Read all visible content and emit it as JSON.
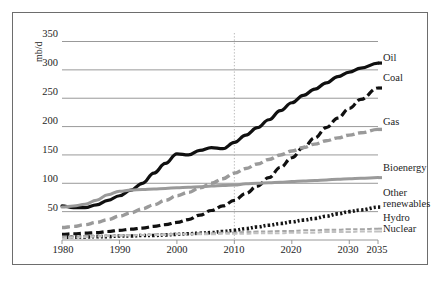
{
  "chart_data": {
    "type": "line",
    "title": "",
    "subtitle": "",
    "xlabel": "",
    "ylabel": "mb/d",
    "xlim": [
      1980,
      2035
    ],
    "ylim": [
      0,
      365
    ],
    "x_ticks": [
      1980,
      1990,
      2000,
      2010,
      2020,
      2030,
      2035
    ],
    "y_ticks": [
      50,
      100,
      150,
      200,
      250,
      300,
      350
    ],
    "grid": "horizontal",
    "legend_position": "right-inline-labels",
    "annotations": [
      {
        "name": "history-projection-divider",
        "type": "vline",
        "x": 2010,
        "style": "dotted"
      }
    ],
    "x": [
      1980,
      1982,
      1984,
      1986,
      1988,
      1990,
      1992,
      1994,
      1996,
      1998,
      2000,
      2002,
      2004,
      2006,
      2008,
      2010,
      2012,
      2014,
      2016,
      2018,
      2020,
      2022,
      2024,
      2026,
      2028,
      2030,
      2032,
      2035
    ],
    "series": [
      {
        "name": "Oil",
        "label": "Oil",
        "color": "#101010",
        "style": "solid",
        "width": 3.2,
        "values": [
          60,
          57,
          57,
          62,
          70,
          78,
          88,
          100,
          118,
          135,
          152,
          150,
          158,
          163,
          161,
          172,
          185,
          198,
          212,
          228,
          242,
          255,
          266,
          277,
          288,
          296,
          303,
          312
        ]
      },
      {
        "name": "Coal",
        "label": "Coal",
        "color": "#101010",
        "style": "dashed",
        "width": 3.2,
        "values": [
          10,
          11,
          12,
          13,
          15,
          17,
          19,
          21,
          24,
          27,
          31,
          36,
          44,
          52,
          60,
          70,
          82,
          95,
          110,
          128,
          145,
          163,
          180,
          198,
          215,
          232,
          248,
          268
        ]
      },
      {
        "name": "Gas",
        "label": "Gas",
        "color": "#9a9a9a",
        "style": "dashed",
        "width": 3.4,
        "values": [
          22,
          24,
          27,
          31,
          36,
          42,
          48,
          55,
          62,
          70,
          78,
          84,
          92,
          100,
          108,
          118,
          126,
          134,
          142,
          150,
          157,
          163,
          169,
          175,
          180,
          185,
          189,
          195
        ]
      },
      {
        "name": "Bioenergy",
        "label": "Bioenergy",
        "color": "#9a9a9a",
        "style": "solid",
        "width": 3.0,
        "values": [
          58,
          60,
          63,
          70,
          80,
          86,
          88,
          89,
          90,
          91,
          92,
          93,
          94,
          95,
          96,
          97,
          99,
          100,
          101,
          102,
          103,
          104,
          105,
          106,
          107,
          108,
          109,
          110
        ]
      },
      {
        "name": "Other renewables",
        "label_line1": "Other",
        "label_line2": "renewables",
        "color": "#141414",
        "style": "dotted",
        "width": 3.6,
        "values": [
          5,
          5,
          5,
          6,
          6,
          7,
          7,
          8,
          8,
          9,
          10,
          11,
          12,
          13,
          15,
          17,
          20,
          23,
          26,
          29,
          32,
          35,
          38,
          42,
          46,
          50,
          53,
          58
        ]
      },
      {
        "name": "Hydro",
        "label": "Hydro",
        "color": "#a6a6a6",
        "style": "dashed",
        "width": 2.0,
        "values": [
          6,
          6,
          7,
          7,
          8,
          8,
          9,
          9,
          10,
          10,
          11,
          11,
          12,
          12,
          13,
          13,
          14,
          15,
          15,
          16,
          16,
          17,
          17,
          18,
          18,
          19,
          19,
          20
        ]
      },
      {
        "name": "Nuclear",
        "label": "Nuclear",
        "color": "#c2c2c2",
        "style": "dashed",
        "width": 2.0,
        "values": [
          3,
          4,
          5,
          6,
          7,
          8,
          8,
          9,
          9,
          9,
          10,
          10,
          10,
          10,
          11,
          11,
          11,
          12,
          12,
          12,
          13,
          13,
          13,
          14,
          14,
          14,
          15,
          15
        ]
      }
    ]
  },
  "axis": {
    "y_title": "mb/d",
    "y_tick_labels": [
      "350",
      "300",
      "250",
      "200",
      "150",
      "100",
      "50"
    ],
    "x_tick_labels": [
      "1980",
      "1990",
      "2000",
      "2010",
      "2020",
      "2030",
      "2035"
    ]
  },
  "labels": {
    "oil": "Oil",
    "coal": "Coal",
    "gas": "Gas",
    "bioenergy": "Bioenergy",
    "other_renewables_line1": "Other",
    "other_renewables_line2": "renewables",
    "hydro": "Hydro",
    "nuclear": "Nuclear"
  },
  "colors": {
    "oil": "#101010",
    "coal": "#101010",
    "gas": "#9a9a9a",
    "bioenergy": "#9a9a9a",
    "other_renewables": "#141414",
    "hydro": "#a6a6a6",
    "nuclear": "#c2c2c2",
    "grid": "#8d8d8d",
    "frame": "#6d6d6d",
    "text": "#1d1d1d"
  }
}
